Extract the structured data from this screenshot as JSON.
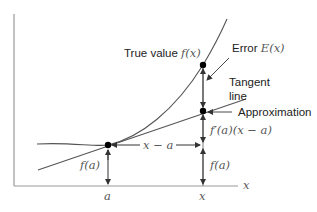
{
  "diagram": {
    "labels": {
      "true_value_prefix": "True value ",
      "true_value_math": "f(x)",
      "error_prefix": "Error ",
      "error_math": "E(x)",
      "tangent_line_1": "Tangent",
      "tangent_line_2": "line",
      "approximation": "Approximation",
      "derivative_term": "f′(a)(x − a)",
      "fa_left": "f(a)",
      "fa_right": "f(a)",
      "x_minus_a": "x − a",
      "axis_x": "x",
      "tick_a": "a",
      "tick_x": "x"
    },
    "colors": {
      "axis": "#888888",
      "curve": "#555555",
      "point": "#000000",
      "text": "#222222",
      "math": "#555555"
    }
  }
}
